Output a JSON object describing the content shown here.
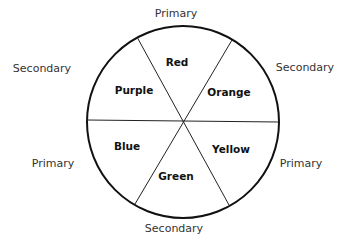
{
  "diagram": {
    "type": "color-wheel",
    "segments": [
      {
        "name": "Red",
        "category": "Primary"
      },
      {
        "name": "Orange",
        "category": "Secondary"
      },
      {
        "name": "Yellow",
        "category": "Primary"
      },
      {
        "name": "Green",
        "category": "Secondary"
      },
      {
        "name": "Blue",
        "category": "Primary"
      },
      {
        "name": "Purple",
        "category": "Secondary"
      }
    ],
    "outer_labels": {
      "top": "Primary",
      "top_right": "Secondary",
      "bottom_right": "Primary",
      "bottom": "Secondary",
      "bottom_left": "Primary",
      "top_left": "Secondary"
    }
  }
}
